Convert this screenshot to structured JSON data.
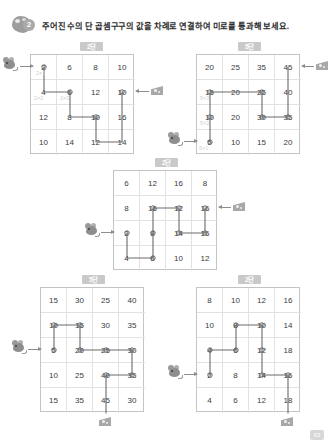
{
  "header": {
    "badge_number": "2",
    "badge_icon": "mouse-cheese-icon",
    "instruction": "주어진 수의 단 곱셈구구의 값을 차례로 연결하여 미로를 통과해 보세요."
  },
  "footer": {
    "page_number": "63"
  },
  "mazes": [
    {
      "id": "maze-top-left",
      "label": "2단",
      "cols": 4,
      "rows": 4,
      "grid": [
        [
          "2",
          "6",
          "8",
          "10"
        ],
        [
          "4",
          "6",
          "12",
          "10"
        ],
        [
          "12",
          "8",
          "10",
          "16"
        ],
        [
          "10",
          "14",
          "12",
          "14"
        ]
      ],
      "annotations": [
        "2×1",
        "2×2",
        "2×3"
      ],
      "start_marker": "mouse-icon",
      "end_marker": "cheese-icon"
    },
    {
      "id": "maze-top-right",
      "label": "5단",
      "cols": 4,
      "rows": 4,
      "grid": [
        [
          "20",
          "25",
          "35",
          "45"
        ],
        [
          "15",
          "20",
          "25",
          "40"
        ],
        [
          "10",
          "20",
          "30",
          "35"
        ],
        [
          "5",
          "10",
          "15",
          "20"
        ]
      ],
      "annotations": [
        "5×3",
        "5×2",
        "5×1"
      ],
      "start_marker": "mouse-icon",
      "end_marker": "cheese-icon"
    },
    {
      "id": "maze-middle",
      "label": "2단",
      "cols": 4,
      "rows": 4,
      "grid": [
        [
          "6",
          "12",
          "16",
          "8"
        ],
        [
          "8",
          "16",
          "12",
          "16"
        ],
        [
          "2",
          "8",
          "14",
          "16"
        ],
        [
          "4",
          "6",
          "10",
          "12"
        ]
      ],
      "annotations": [],
      "start_marker": "mouse-icon",
      "end_marker": "cheese-icon"
    },
    {
      "id": "maze-bottom-left",
      "label": "5단",
      "cols": 4,
      "rows": 5,
      "grid": [
        [
          "15",
          "30",
          "25",
          "40"
        ],
        [
          "10",
          "15",
          "30",
          "35"
        ],
        [
          "5",
          "20",
          "25",
          "30"
        ],
        [
          "10",
          "25",
          "40",
          "35"
        ],
        [
          "15",
          "35",
          "45",
          "30"
        ]
      ],
      "annotations": [],
      "start_marker": "mouse-icon",
      "end_marker": "cheese-icon"
    },
    {
      "id": "maze-bottom-right",
      "label": "2단",
      "cols": 4,
      "rows": 5,
      "grid": [
        [
          "8",
          "10",
          "12",
          "16"
        ],
        [
          "10",
          "8",
          "10",
          "14"
        ],
        [
          "4",
          "6",
          "12",
          "18"
        ],
        [
          "2",
          "8",
          "14",
          "16"
        ],
        [
          "4",
          "6",
          "12",
          "18"
        ]
      ],
      "annotations": [],
      "start_marker": "mouse-icon",
      "end_marker": "cheese-icon"
    }
  ]
}
